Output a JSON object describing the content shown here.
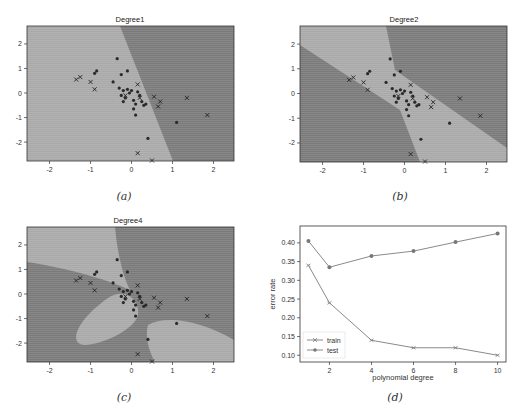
{
  "figure": {
    "background": "#ffffff",
    "colors": {
      "region_dark": "#7a7a7a",
      "region_light": "#a9a9a9",
      "point": "#2a2a2a",
      "line": "#888888",
      "frame": "#333333"
    }
  },
  "chart_data": [
    {
      "type": "scatter",
      "panel": "a",
      "title": "Degree1",
      "caption": "(a)",
      "xlim": [
        -2.55,
        2.5
      ],
      "ylim": [
        -2.77,
        2.73
      ],
      "xticks": [
        -2,
        -1,
        0,
        1,
        2
      ],
      "yticks": [
        -2,
        -1,
        0,
        1,
        2
      ],
      "decision_boundary": "linear",
      "series": [
        {
          "name": "class-dot",
          "marker": "dot",
          "points": [
            [
              -0.35,
              1.4
            ],
            [
              -0.1,
              0.9
            ],
            [
              -0.25,
              0.75
            ],
            [
              -0.45,
              0.45
            ],
            [
              -0.3,
              0.2
            ],
            [
              -0.2,
              0.1
            ],
            [
              -0.25,
              -0.1
            ],
            [
              -0.15,
              -0.2
            ],
            [
              -0.2,
              -0.35
            ],
            [
              -0.05,
              0.0
            ],
            [
              0.0,
              0.1
            ],
            [
              0.05,
              -0.3
            ],
            [
              0.1,
              -0.45
            ],
            [
              0.05,
              -0.65
            ],
            [
              0.1,
              -0.9
            ],
            [
              0.25,
              -0.35
            ],
            [
              0.3,
              -0.5
            ],
            [
              0.2,
              -0.1
            ],
            [
              0.15,
              0.05
            ],
            [
              -0.1,
              0.15
            ],
            [
              0.35,
              -0.45
            ],
            [
              0.4,
              -1.85
            ],
            [
              1.1,
              -1.2
            ],
            [
              -0.85,
              0.9
            ],
            [
              -0.9,
              0.8
            ]
          ]
        },
        {
          "name": "class-x",
          "marker": "x",
          "points": [
            [
              -1.35,
              0.55
            ],
            [
              -1.25,
              0.65
            ],
            [
              -1.0,
              0.45
            ],
            [
              -0.9,
              0.15
            ],
            [
              0.15,
              0.35
            ],
            [
              0.55,
              -0.15
            ],
            [
              0.65,
              -0.55
            ],
            [
              0.7,
              -0.35
            ],
            [
              1.35,
              -0.2
            ],
            [
              1.85,
              -0.9
            ],
            [
              0.15,
              -2.45
            ],
            [
              0.5,
              -2.75
            ],
            [
              -0.15,
              -0.1
            ],
            [
              0.2,
              -0.2
            ]
          ]
        }
      ]
    },
    {
      "type": "scatter",
      "panel": "b",
      "title": "Degree2",
      "caption": "(b)",
      "xlim": [
        -2.55,
        2.5
      ],
      "ylim": [
        -2.77,
        2.73
      ],
      "xticks": [
        -2,
        -1,
        0,
        1,
        2
      ],
      "yticks": [
        -2,
        -1,
        0,
        1,
        2
      ],
      "decision_boundary": "quadratic"
    },
    {
      "type": "scatter",
      "panel": "c",
      "title": "Degree4",
      "caption": "(c)",
      "xlim": [
        -2.55,
        2.5
      ],
      "ylim": [
        -2.77,
        2.73
      ],
      "xticks": [
        -2,
        -1,
        0,
        1,
        2
      ],
      "yticks": [
        -2,
        -1,
        0,
        1,
        2
      ],
      "decision_boundary": "quartic"
    },
    {
      "type": "line",
      "panel": "d",
      "title": "",
      "caption": "(d)",
      "xlabel": "polynomial degree",
      "ylabel": "error rate",
      "xlim": [
        0.6,
        10.4
      ],
      "ylim": [
        0.082,
        0.445
      ],
      "xticks": [
        2,
        4,
        6,
        8,
        10
      ],
      "yticks": [
        0.1,
        0.15,
        0.2,
        0.25,
        0.3,
        0.35,
        0.4
      ],
      "ytick_labels": [
        "0.10",
        "0.15",
        "0.20",
        "0.25",
        "0.30",
        "0.35",
        "0.40"
      ],
      "legend_position": "lower left",
      "x": [
        1,
        2,
        4,
        6,
        8,
        10
      ],
      "series": [
        {
          "name": "train",
          "marker": "x",
          "values": [
            0.34,
            0.24,
            0.14,
            0.12,
            0.12,
            0.1
          ]
        },
        {
          "name": "test",
          "marker": "o",
          "values": [
            0.405,
            0.335,
            0.365,
            0.378,
            0.402,
            0.425
          ]
        }
      ]
    }
  ]
}
